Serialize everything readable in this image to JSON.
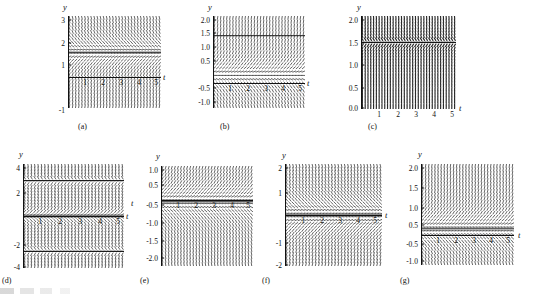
{
  "figure": {
    "kind": "direction-field-grid",
    "panel_count": 7,
    "background": "#ffffff",
    "ink": "#1a1a1a"
  },
  "chart_data": [
    {
      "type": "scatter",
      "panel": "a",
      "caption": "(a)",
      "title": "",
      "xlabel": "t",
      "ylabel": "y",
      "grid": false,
      "legend": "none",
      "xlim": [
        0,
        5.4
      ],
      "ylim": [
        -1.35,
        3.35
      ],
      "xticks": [
        1,
        2,
        3,
        4,
        5
      ],
      "xticklabels": [
        "1",
        "2",
        "3",
        "4",
        "5"
      ],
      "yticks": [
        3,
        2,
        1,
        -1
      ],
      "yticklabels": [
        "3",
        "2",
        "1",
        "-1"
      ],
      "field": "dy/dt = 3 - 2y",
      "equilibrium_y": [
        1.5
      ],
      "slope_rule": "k*(eq - y)",
      "k": 2.0,
      "eq": 1.5,
      "slope_clip": 6.0,
      "nx": 30,
      "ny": 26
    },
    {
      "type": "scatter",
      "panel": "b",
      "caption": "(b)",
      "title": "",
      "xlabel": "t",
      "ylabel": "y",
      "grid": false,
      "legend": "none",
      "xlim": [
        0,
        5.4
      ],
      "ylim": [
        -1.25,
        2.25
      ],
      "xticks": [
        1,
        2,
        3,
        4,
        5
      ],
      "xticklabels": [
        "1",
        "2",
        "3",
        "4",
        "5"
      ],
      "yticks": [
        2.0,
        1.5,
        1.0,
        0.5,
        -0.5,
        -1.0
      ],
      "yticklabels": [
        "2.0",
        "1.5",
        "1.0",
        "0.5",
        "-0.5",
        "-1.0"
      ],
      "field": "dy/dt = 2y - 3",
      "equilibrium_y": [
        1.5
      ],
      "slope_rule": "k*(y - eq)",
      "k": 2.0,
      "eq": 0.0,
      "slope_clip": 6.0,
      "nx": 30,
      "ny": 24
    },
    {
      "type": "scatter",
      "panel": "c",
      "caption": "(c)",
      "title": "",
      "xlabel": "t",
      "ylabel": "y",
      "grid": false,
      "legend": "none",
      "xlim": [
        0,
        5.4
      ],
      "ylim": [
        0.0,
        2.1
      ],
      "xticks": [
        1,
        2,
        3,
        4,
        5
      ],
      "xticklabels": [
        "1",
        "2",
        "3",
        "4",
        "5"
      ],
      "yticks": [
        2.0,
        1.5,
        1.0,
        0.5,
        0.0
      ],
      "yticklabels": [
        "2.0",
        "1.5",
        "1.0",
        "0.5",
        "0.0"
      ],
      "field": "dy/dt = 3 - 2y (steep)",
      "equilibrium_y": [
        1.5
      ],
      "slope_rule": "steep-dense",
      "k": 9.0,
      "eq": 1.5,
      "slope_clip": 20.0,
      "nx": 34,
      "ny": 30
    },
    {
      "type": "scatter",
      "panel": "d",
      "caption": "(d)",
      "title": "",
      "xlabel": "t",
      "ylabel": "y",
      "grid": false,
      "legend": "none",
      "xlim": [
        0,
        5.4
      ],
      "ylim": [
        -4.4,
        4.4
      ],
      "xticks": [
        1,
        2,
        3,
        4,
        5
      ],
      "xticklabels": [
        "1",
        "2",
        "3",
        "4",
        "5"
      ],
      "yticks": [
        4,
        2,
        -2,
        -4
      ],
      "yticklabels": [
        "4",
        "2",
        "-2",
        "-4"
      ],
      "field": "dy/dt = y(y^2 - 9) style",
      "equilibrium_y": [
        3,
        0,
        -3
      ],
      "slope_rule": "cubic",
      "k": 1.0,
      "eq": 0.0,
      "slope_clip": 9.0,
      "nx": 30,
      "ny": 34
    },
    {
      "type": "scatter",
      "panel": "e",
      "caption": "(e)",
      "title": "",
      "xlabel": "t",
      "ylabel": "y",
      "grid": false,
      "legend": "none",
      "xlim": [
        0,
        5.4
      ],
      "ylim": [
        -2.15,
        1.2
      ],
      "xticks": [
        1,
        2,
        3,
        4,
        5
      ],
      "xticklabels": [
        "1",
        "2",
        "3",
        "4",
        "5"
      ],
      "yticks": [
        1.0,
        0.5,
        -0.5,
        -1.0,
        -1.5,
        -2.0
      ],
      "yticklabels": [
        "1.0",
        "0.5",
        "-0.5",
        "-1.0",
        "-1.5",
        "-2.0"
      ],
      "field": "dy/dt = -y - 1 style",
      "equilibrium_y": [
        0
      ],
      "slope_rule": "k*(y - eq)",
      "k": 1.6,
      "eq": 0.0,
      "slope_clip": 6.0,
      "nx": 30,
      "ny": 28
    },
    {
      "type": "scatter",
      "panel": "f",
      "caption": "(f)",
      "title": "",
      "xlabel": "t",
      "ylabel": "y",
      "grid": false,
      "legend": "none",
      "xlim": [
        0,
        5.4
      ],
      "ylim": [
        -2.2,
        2.2
      ],
      "xticks": [
        1,
        2,
        3,
        4,
        5
      ],
      "xticklabels": [
        "1",
        "2",
        "3",
        "4",
        "5"
      ],
      "yticks": [
        2,
        1,
        -1,
        -2
      ],
      "yticklabels": [
        "2",
        "1",
        "-1",
        "-2"
      ],
      "field": "dy/dt = y - 2 style",
      "equilibrium_y": [
        0
      ],
      "slope_rule": "k*(eq - y)",
      "k": 1.5,
      "eq": 0.0,
      "slope_clip": 6.0,
      "nx": 30,
      "ny": 30
    },
    {
      "type": "scatter",
      "panel": "g",
      "caption": "(g)",
      "title": "",
      "xlabel": "t",
      "ylabel": "y",
      "grid": false,
      "legend": "none",
      "xlim": [
        0,
        5.4
      ],
      "ylim": [
        -1.2,
        2.15
      ],
      "xticks": [
        1,
        2,
        3,
        4,
        5
      ],
      "xticklabels": [
        "1",
        "2",
        "3",
        "4",
        "5"
      ],
      "yticks": [
        2.0,
        1.5,
        1.0,
        0.5,
        -0.5,
        -1.0
      ],
      "yticklabels": [
        "2.0",
        "1.5",
        "1.0",
        "0.5",
        "-0.5",
        "-1.0"
      ],
      "field": "dy/dt = -y style",
      "equilibrium_y": [
        0
      ],
      "slope_rule": "k*(y - eq)",
      "k": 1.7,
      "eq": 0.0,
      "slope_clip": 6.0,
      "nx": 30,
      "ny": 28
    }
  ],
  "panels": {
    "a": {
      "caption": "(a)",
      "xlabel": "t",
      "ylabel": "y",
      "box": {
        "left": 68,
        "top": 16,
        "width": 93,
        "height": 92
      },
      "axis_y_px": 77,
      "ylabel_pos": {
        "left": 63,
        "top": 3
      },
      "xlabel_pos": {
        "left": 163,
        "top": 73
      },
      "caption_pos": {
        "left": 78,
        "top": 123
      },
      "yticks": [
        {
          "label": "3",
          "top": 17
        },
        {
          "label": "2",
          "top": 40
        },
        {
          "label": "1",
          "top": 62
        },
        {
          "label": "-1",
          "top": 107
        }
      ],
      "xticks": [
        {
          "label": "1",
          "left": 85
        },
        {
          "label": "2",
          "left": 103
        },
        {
          "label": "3",
          "left": 121
        },
        {
          "label": "4",
          "left": 139
        },
        {
          "label": "5",
          "left": 156
        }
      ]
    },
    "b": {
      "caption": "(b)",
      "xlabel": "t",
      "ylabel": "y",
      "box": {
        "left": 213,
        "top": 16,
        "width": 92,
        "height": 92
      },
      "axis_y_px": 83,
      "ylabel_pos": {
        "left": 208,
        "top": 3
      },
      "xlabel_pos": {
        "left": 307,
        "top": 79
      },
      "caption_pos": {
        "left": 220,
        "top": 123
      },
      "yticks": [
        {
          "label": "2.0",
          "top": 17
        },
        {
          "label": "1.5",
          "top": 30
        },
        {
          "label": "1.0",
          "top": 44
        },
        {
          "label": "0.5",
          "top": 58
        },
        {
          "label": "-0.5",
          "top": 85
        },
        {
          "label": "-1.0",
          "top": 99
        }
      ],
      "xticks": [
        {
          "label": "1",
          "left": 230
        },
        {
          "label": "2",
          "left": 248
        },
        {
          "label": "3",
          "left": 266
        },
        {
          "label": "4",
          "left": 283
        },
        {
          "label": "5",
          "left": 300
        }
      ]
    },
    "c": {
      "caption": "(c)",
      "xlabel": "t",
      "ylabel": "y",
      "box": {
        "left": 361,
        "top": 16,
        "width": 95,
        "height": 93
      },
      "axis_y_px": 109,
      "ylabel_pos": {
        "left": 357,
        "top": 3
      },
      "xlabel_pos": {
        "left": 459,
        "top": 104
      },
      "caption_pos": {
        "left": 368,
        "top": 123
      },
      "yticks": [
        {
          "label": "2.0",
          "top": 17
        },
        {
          "label": "1.5",
          "top": 40
        },
        {
          "label": "1.0",
          "top": 62
        },
        {
          "label": "0.5",
          "top": 85
        },
        {
          "label": "0.0",
          "top": 105
        }
      ],
      "xticks": [
        {
          "label": "1",
          "left": 379
        },
        {
          "label": "2",
          "left": 398
        },
        {
          "label": "3",
          "left": 416
        },
        {
          "label": "4",
          "left": 434
        },
        {
          "label": "5",
          "left": 452
        }
      ]
    },
    "d": {
      "caption": "(d)",
      "xlabel": "t",
      "ylabel": "y",
      "box": {
        "left": 23,
        "top": 164,
        "width": 101,
        "height": 104
      },
      "axis_y_px": 216,
      "ylabel_pos": {
        "left": 19,
        "top": 150
      },
      "xlabel_pos": {
        "left": 126,
        "top": 212
      },
      "caption_pos": {
        "left": 2,
        "top": 277
      },
      "yticks": [
        {
          "label": "4",
          "top": 165
        },
        {
          "label": "2",
          "top": 190
        },
        {
          "label": "-2",
          "top": 242
        },
        {
          "label": "-4",
          "top": 264
        }
      ],
      "xticks": [
        {
          "label": "1",
          "left": 40
        },
        {
          "label": "2",
          "left": 60
        },
        {
          "label": "3",
          "left": 80
        },
        {
          "label": "4",
          "left": 100
        },
        {
          "label": "5",
          "left": 118
        }
      ]
    },
    "e": {
      "caption": "(e)",
      "xlabel": "t",
      "ylabel": "y",
      "box": {
        "left": 161,
        "top": 166,
        "width": 92,
        "height": 100
      },
      "axis_y_px": 200,
      "ylabel_pos": {
        "left": 156,
        "top": 152
      },
      "xlabel_pos": {
        "left": 131,
        "top": 199
      },
      "caption_pos": {
        "left": 140,
        "top": 277
      },
      "yticks": [
        {
          "label": "1.0",
          "top": 167
        },
        {
          "label": "0.5",
          "top": 182
        },
        {
          "label": "-0.5",
          "top": 202
        },
        {
          "label": "-1.0",
          "top": 220
        },
        {
          "label": "-1.5",
          "top": 238
        },
        {
          "label": "-2.0",
          "top": 255
        }
      ],
      "xticks": [
        {
          "label": "1",
          "left": 178
        },
        {
          "label": "2",
          "left": 196
        },
        {
          "label": "3",
          "left": 214
        },
        {
          "label": "4",
          "left": 232
        },
        {
          "label": "5",
          "left": 248
        }
      ]
    },
    "f": {
      "caption": "(f)",
      "xlabel": "t",
      "ylabel": "y",
      "box": {
        "left": 285,
        "top": 164,
        "width": 97,
        "height": 102
      },
      "axis_y_px": 215,
      "ylabel_pos": {
        "left": 282,
        "top": 151
      },
      "xlabel_pos": {
        "left": 385,
        "top": 211
      },
      "caption_pos": {
        "left": 262,
        "top": 277
      },
      "yticks": [
        {
          "label": "2",
          "top": 165
        },
        {
          "label": "1",
          "top": 190
        },
        {
          "label": "-1",
          "top": 240
        },
        {
          "label": "-2",
          "top": 262
        }
      ],
      "xticks": [
        {
          "label": "1",
          "left": 303
        },
        {
          "label": "2",
          "left": 322
        },
        {
          "label": "3",
          "left": 340
        },
        {
          "label": "4",
          "left": 358
        },
        {
          "label": "5",
          "left": 375
        }
      ]
    },
    "g": {
      "caption": "(g)",
      "xlabel": "t",
      "ylabel": "y",
      "box": {
        "left": 421,
        "top": 164,
        "width": 93,
        "height": 101
      },
      "axis_y_px": 235,
      "ylabel_pos": {
        "left": 418,
        "top": 150
      },
      "xlabel_pos": {
        "left": 518,
        "top": 231
      },
      "caption_pos": {
        "left": 400,
        "top": 277
      },
      "yticks": [
        {
          "label": "2.0",
          "top": 165
        },
        {
          "label": "1.5",
          "top": 185
        },
        {
          "label": "1.0",
          "top": 205
        },
        {
          "label": "0.5",
          "top": 222
        },
        {
          "label": "-0.5",
          "top": 241
        },
        {
          "label": "-1.0",
          "top": 258
        }
      ],
      "xticks": [
        {
          "label": "1",
          "left": 438
        },
        {
          "label": "2",
          "left": 456
        },
        {
          "label": "3",
          "left": 474
        },
        {
          "label": "4",
          "left": 491
        },
        {
          "label": "5",
          "left": 508
        }
      ]
    }
  }
}
